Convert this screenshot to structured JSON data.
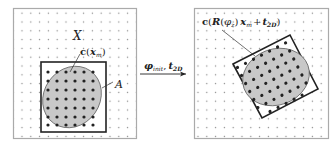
{
  "diagram": {
    "type": "transformation-illustration",
    "left_panel": {
      "grid_label": "X",
      "set_label": "A",
      "sample_label": {
        "func": "c",
        "arg": "x",
        "arg_sub": "m"
      },
      "fill_color": "#c8c8c8",
      "frame_color": "#aaaaaa",
      "box_color": "#222222"
    },
    "arrow": {
      "label_phi": "φ",
      "label_phi_sub": "init",
      "separator": ",",
      "label_t": "t",
      "label_t_sub": "2D"
    },
    "right_panel": {
      "sample_label": {
        "func": "c",
        "R": "R",
        "phi": "φ",
        "phi_sub": "z",
        "x": "x",
        "x_sub": "m",
        "plus": "+",
        "t": "t",
        "t_sub": "2D"
      }
    }
  }
}
